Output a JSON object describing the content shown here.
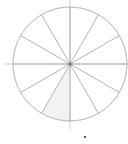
{
  "figure": {
    "title": "",
    "subtitle": "",
    "background_color": "#ffffff",
    "width": 128,
    "height": 144
  },
  "geometry": {
    "center_x": 70,
    "center_y": 64,
    "radius": 57,
    "axis_overshoot": 8,
    "start_angle_deg": 90,
    "direction": "clockwise"
  },
  "style": {
    "outline_color": "#b8b8bc",
    "outline_width": 0.7,
    "fill_color": "#f2f2f2",
    "unfilled_color": "#ffffff",
    "center_dot_color": "#6d6d72",
    "footer_mark_color": "#5a5a5f"
  },
  "footer_mark": {
    "label": "tick-mark",
    "x": 85,
    "y": 137,
    "width": 2,
    "height": 2
  },
  "center_dot": {
    "label": "pie-center",
    "radius": 1.6
  },
  "chart_data": {
    "type": "pie",
    "title": "",
    "subtitle": "",
    "xlabel": "",
    "ylabel": "",
    "grid": false,
    "legend_position": "none",
    "slice_count": 12,
    "slice_angle_deg": 30,
    "equal_slices": true,
    "categories": [
      "1",
      "2",
      "3",
      "4",
      "5",
      "6",
      "7",
      "8",
      "9",
      "10",
      "11",
      "12"
    ],
    "values": [
      8.3333,
      8.3333,
      8.3333,
      8.3333,
      8.3333,
      8.3333,
      8.3333,
      8.3333,
      8.3333,
      8.3333,
      8.3333,
      8.3333
    ],
    "value_unit": "percent",
    "highlighted_index": 6,
    "highlighted_label": "7",
    "slice_fills": [
      "#ffffff",
      "#ffffff",
      "#ffffff",
      "#ffffff",
      "#ffffff",
      "#ffffff",
      "#f2f2f2",
      "#ffffff",
      "#ffffff",
      "#ffffff",
      "#ffffff",
      "#ffffff"
    ],
    "annotations": [],
    "tick_labels": [],
    "legend_entries": []
  }
}
